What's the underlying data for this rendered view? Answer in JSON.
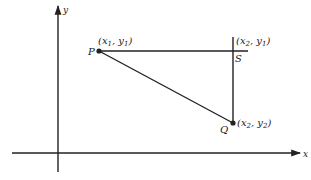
{
  "diagram": {
    "colors": {
      "ink": "#222222",
      "background": "#ffffff"
    },
    "axes": {
      "x_label": "x",
      "y_label": "y"
    },
    "points": {
      "P": {
        "name": "P",
        "coord_open": "(x",
        "sub1": "1",
        "comma": ", y",
        "sub2": "1",
        "coord_close": ")"
      },
      "S": {
        "name": "S",
        "coord_open": "(x",
        "sub1": "2",
        "comma": ", y",
        "sub2": "1",
        "coord_close": ")"
      },
      "Q": {
        "name": "Q",
        "coord_open": "(x",
        "sub1": "2",
        "comma": ", y",
        "sub2": "2",
        "coord_close": ")"
      }
    }
  }
}
